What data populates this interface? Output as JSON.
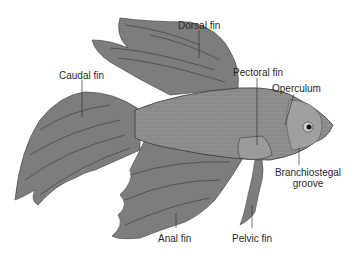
{
  "diagram": {
    "labels": {
      "caudal_fin": "Caudal fin",
      "dorsal_fin": "Dorsal fin",
      "pectoral_fin": "Pectoral fin",
      "operculum": "Operculum",
      "branchiostegal_line1": "Branchiostegal",
      "branchiostegal_line2": "groove",
      "anal_fin": "Anal fin",
      "pelvic_fin": "Pelvic fin"
    },
    "colors": {
      "fin": "#7d7d7d",
      "fin_stripe": "#4a4a4a",
      "body": "#8c8c8c",
      "body_light": "#a8a8a8",
      "outline": "#3a3a3a",
      "leader_line": "#333333",
      "text": "#2a2a2a",
      "background": "#ffffff"
    }
  }
}
